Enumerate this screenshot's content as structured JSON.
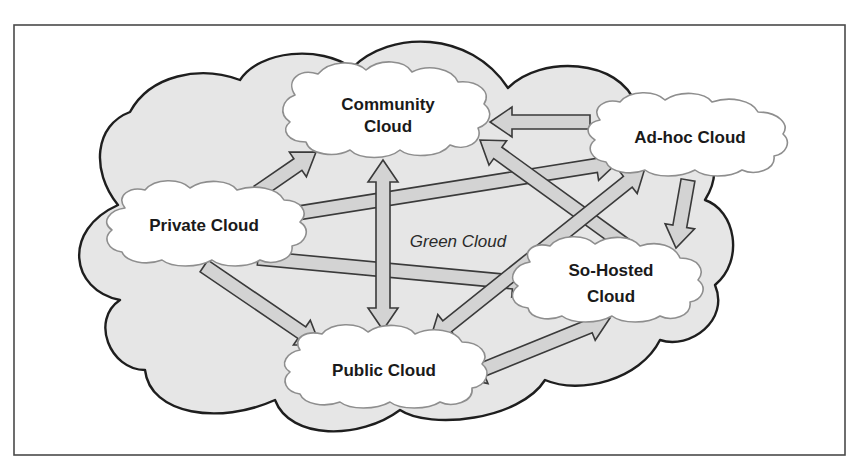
{
  "diagram": {
    "title": "Green Cloud",
    "container_label": "Green Cloud",
    "nodes": [
      {
        "id": "community",
        "lines": [
          "Community",
          "Cloud"
        ]
      },
      {
        "id": "adhoc",
        "lines": [
          "Ad-hoc Cloud"
        ]
      },
      {
        "id": "private",
        "lines": [
          "Private Cloud"
        ]
      },
      {
        "id": "sohosted",
        "lines": [
          "So-Hosted",
          "Cloud"
        ]
      },
      {
        "id": "public",
        "lines": [
          "Public Cloud"
        ]
      }
    ],
    "edges": [
      {
        "from": "private",
        "to": "community",
        "direction": "forward"
      },
      {
        "from": "private",
        "to": "adhoc",
        "direction": "forward"
      },
      {
        "from": "private",
        "to": "sohosted",
        "direction": "forward"
      },
      {
        "from": "private",
        "to": "public",
        "direction": "forward"
      },
      {
        "from": "adhoc",
        "to": "community",
        "direction": "forward"
      },
      {
        "from": "adhoc",
        "to": "sohosted",
        "direction": "forward"
      },
      {
        "from": "sohosted",
        "to": "community",
        "direction": "forward"
      },
      {
        "from": "community",
        "to": "public",
        "direction": "both"
      },
      {
        "from": "public",
        "to": "adhoc",
        "direction": "both"
      },
      {
        "from": "public",
        "to": "sohosted",
        "direction": "both"
      }
    ],
    "colors": {
      "container_fill": "#e6e6e6",
      "node_fill": "#ffffff",
      "arrow_fill": "#d3d3d3",
      "outline": "#1e1e1e"
    }
  }
}
